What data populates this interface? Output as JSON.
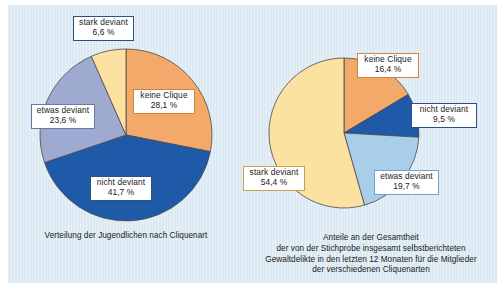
{
  "figure": {
    "background_color": "#dbe9f3",
    "page_color": "#ffffff"
  },
  "palette": {
    "keine_clique": "#F3A96A",
    "nicht_deviant": "#1F5AA8",
    "etwas_deviant_left": "#9EAAD0",
    "etwas_deviant_right": "#A9CEE9",
    "stark_deviant": "#FBE2A0",
    "outline": "#4a4a4a",
    "text": "#1a1a1a"
  },
  "left_chart": {
    "caption_lines": [
      "Verteilung der Jugendlichen nach Cliquenart"
    ],
    "labels": [
      {
        "name": "stark deviant",
        "value": "6,6 %"
      },
      {
        "name": "keine Clique",
        "value": "28,1 %"
      },
      {
        "name": "nicht deviant",
        "value": "41,7 %"
      },
      {
        "name": "etwas deviant",
        "value": "23,6 %"
      }
    ]
  },
  "right_chart": {
    "caption_lines": [
      "Anteile an der Gesamtheit",
      "der von der Stichprobe insgesamt selbstberichteten",
      "Gewaltdelikte in den letzten 12 Monaten für die Mitglieder",
      "der verschiedenen Cliquenarten"
    ],
    "labels": [
      {
        "name": "keine Clique",
        "value": "16,4 %"
      },
      {
        "name": "nicht deviant",
        "value": "9,5 %"
      },
      {
        "name": "etwas deviant",
        "value": "19,7 %"
      },
      {
        "name": "stark deviant",
        "value": "54,4 %"
      }
    ]
  },
  "chart_data": [
    {
      "type": "pie",
      "title": "Verteilung der Jugendlichen nach Cliquenart",
      "categories": [
        "keine Clique",
        "nicht deviant",
        "etwas deviant",
        "stark deviant"
      ],
      "values": [
        28.1,
        41.7,
        23.6,
        6.6
      ],
      "value_labels": [
        "28,1 %",
        "41,7 %",
        "23,6 %",
        "6,6 %"
      ],
      "colors": [
        "#F3A96A",
        "#1F5AA8",
        "#9EAAD0",
        "#FBE2A0"
      ],
      "start_angle_deg": 0,
      "direction": "clockwise",
      "legend": "labels-on-slices",
      "unit": "%"
    },
    {
      "type": "pie",
      "title": "Anteile an der Gesamtheit der von der Stichprobe insgesamt selbstberichteten Gewaltdelikte in den letzten 12 Monaten für die Mitglieder der verschiedenen Cliquenarten",
      "categories": [
        "keine Clique",
        "nicht deviant",
        "etwas deviant",
        "stark deviant"
      ],
      "values": [
        16.4,
        9.5,
        19.7,
        54.4
      ],
      "value_labels": [
        "16,4 %",
        "9,5 %",
        "19,7 %",
        "54,4 %"
      ],
      "colors": [
        "#F3A96A",
        "#1F5AA8",
        "#A9CEE9",
        "#FBE2A0"
      ],
      "start_angle_deg": 0,
      "direction": "clockwise",
      "legend": "labels-on-slices",
      "unit": "%"
    }
  ]
}
